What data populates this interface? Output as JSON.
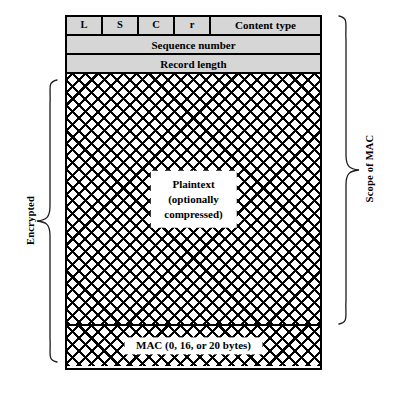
{
  "figure": {
    "background_color": "#ffffff",
    "header_fill_color": "#d6d6d6",
    "line_color": "#000000"
  },
  "record": {
    "header_row": {
      "flags": [
        {
          "key": "L",
          "label": "L"
        },
        {
          "key": "S",
          "label": "S"
        },
        {
          "key": "C",
          "label": "C"
        },
        {
          "key": "r",
          "label": "r"
        }
      ],
      "content_type": "Content type"
    },
    "rows": [
      {
        "key": "sequence_number",
        "label": "Sequence number",
        "fill": "#d6d6d6"
      },
      {
        "key": "record_length",
        "label": "Record length",
        "fill": "#d6d6d6"
      }
    ],
    "payload": {
      "line1": "Plaintext",
      "line2": "(optionally",
      "line3": "compressed)",
      "fill": "cross-hatch"
    },
    "mac": {
      "label": "MAC (0, 16, or 20 bytes)",
      "fill": "cross-hatch"
    }
  },
  "annotations": {
    "left_brace_label": "Encrypted",
    "right_brace_label": "Scope of MAC"
  }
}
